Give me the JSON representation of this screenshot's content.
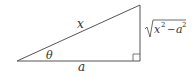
{
  "diagram": {
    "type": "right-triangle",
    "labels": {
      "hypotenuse": "x",
      "angle": "θ",
      "adjacent": "a",
      "opposite": {
        "base1": "x",
        "exp1": "2",
        "minus": "−",
        "base2": "a",
        "exp2": "2"
      }
    },
    "colors": {
      "stroke": "#555555",
      "text": "#333333"
    }
  }
}
